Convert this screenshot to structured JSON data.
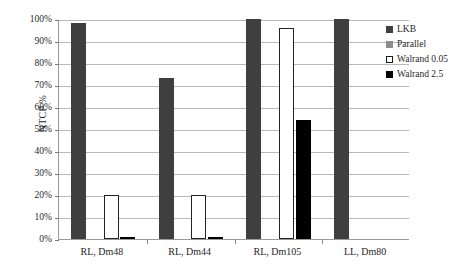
{
  "chart_data": {
    "type": "bar",
    "title": "",
    "xlabel": "",
    "ylabel": "NTCP %",
    "ylim": [
      0,
      100
    ],
    "ytick_labels": [
      "100%",
      "90%",
      "80%",
      "70%",
      "60%",
      "50%",
      "40%",
      "30%",
      "20%",
      "10%",
      "0%"
    ],
    "ytick_values": [
      100,
      90,
      80,
      70,
      60,
      50,
      40,
      30,
      20,
      10,
      0
    ],
    "grid": true,
    "legend_position": "top-right",
    "categories": [
      "RL, Dm48",
      "RL, Dm44",
      "RL, Dm105",
      "LL, Dm80"
    ],
    "series": [
      {
        "name": "LKB",
        "color": "#3f3f3f",
        "values": [
          98,
          73,
          100,
          100
        ]
      },
      {
        "name": "Parallel",
        "color": "#8d8d8d",
        "values": [
          0,
          0,
          0,
          0
        ]
      },
      {
        "name": "Walrand 0.05",
        "color": "#ffffff",
        "values": [
          20,
          20,
          96,
          0
        ]
      },
      {
        "name": "Walrand 2.5",
        "color": "#000000",
        "values": [
          1,
          1,
          54,
          0
        ]
      }
    ]
  },
  "legend": {
    "items": [
      {
        "label": "LKB"
      },
      {
        "label": "Parallel"
      },
      {
        "label": "Walrand 0.05"
      },
      {
        "label": "Walrand 2.5"
      }
    ]
  }
}
